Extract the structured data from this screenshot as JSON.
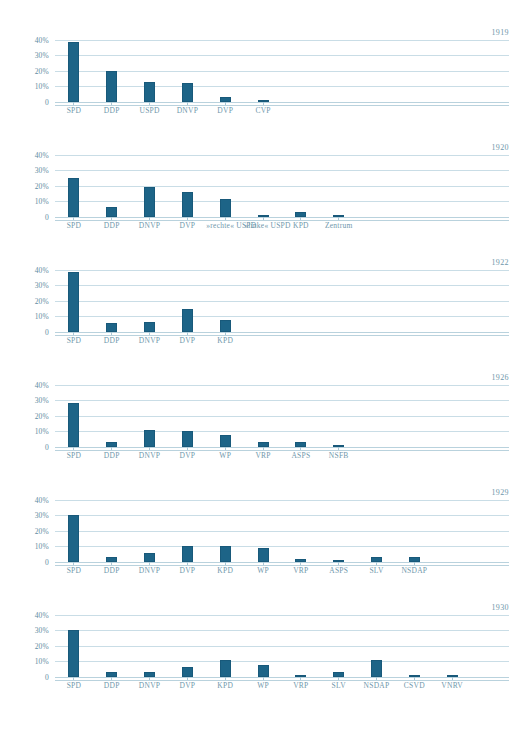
{
  "style": {
    "bar_color": "#1d6487",
    "grid_color": "#c9dde6",
    "label_color": "#6f97ab",
    "background": "#ffffff"
  },
  "axis": {
    "ticks": [
      "40%",
      "30%",
      "20%",
      "10%",
      "0"
    ],
    "values": [
      40,
      30,
      20,
      10,
      0
    ],
    "ymax": 45
  },
  "chart_data": [
    {
      "type": "bar",
      "title": "1919",
      "xlabel": "",
      "ylabel": "",
      "ylim": [
        0,
        45
      ],
      "yticks": [
        0,
        10,
        20,
        30,
        40
      ],
      "ytick_labels": [
        "0",
        "10%",
        "20%",
        "30%",
        "40%"
      ],
      "grid": true,
      "legend": "none",
      "categories": [
        "SPD",
        "DDP",
        "USPD",
        "DNVP",
        "DVP",
        "CVP"
      ],
      "values": [
        38.5,
        20.0,
        13.0,
        12.0,
        3.0,
        1.0
      ]
    },
    {
      "type": "bar",
      "title": "1920",
      "xlabel": "",
      "ylabel": "",
      "ylim": [
        0,
        45
      ],
      "yticks": [
        0,
        10,
        20,
        30,
        40
      ],
      "ytick_labels": [
        "0",
        "10%",
        "20%",
        "30%",
        "40%"
      ],
      "grid": true,
      "legend": "none",
      "categories": [
        "SPD",
        "DDP",
        "DNVP",
        "DVP",
        "»rechte« USPD",
        "»linke« USPD",
        "KPD",
        "Zentrum"
      ],
      "values": [
        25.0,
        6.5,
        19.0,
        16.0,
        11.5,
        0.5,
        3.5,
        0.2
      ]
    },
    {
      "type": "bar",
      "title": "1922",
      "xlabel": "",
      "ylabel": "",
      "ylim": [
        0,
        45
      ],
      "yticks": [
        0,
        10,
        20,
        30,
        40
      ],
      "ytick_labels": [
        "0",
        "10%",
        "20%",
        "30%",
        "40%"
      ],
      "grid": true,
      "legend": "none",
      "categories": [
        "SPD",
        "DDP",
        "DNVP",
        "DVP",
        "KPD"
      ],
      "values": [
        38.5,
        6.0,
        6.5,
        15.0,
        8.0
      ]
    },
    {
      "type": "bar",
      "title": "1926",
      "xlabel": "",
      "ylabel": "",
      "ylim": [
        0,
        45
      ],
      "yticks": [
        0,
        10,
        20,
        30,
        40
      ],
      "ytick_labels": [
        "0",
        "10%",
        "20%",
        "30%",
        "40%"
      ],
      "grid": true,
      "legend": "none",
      "categories": [
        "SPD",
        "DDP",
        "DNVP",
        "DVP",
        "WP",
        "VRP",
        "ASPS",
        "NSFB"
      ],
      "values": [
        28.5,
        3.0,
        11.0,
        10.0,
        8.0,
        3.0,
        3.0,
        1.0
      ]
    },
    {
      "type": "bar",
      "title": "1929",
      "xlabel": "",
      "ylabel": "",
      "ylim": [
        0,
        45
      ],
      "yticks": [
        0,
        10,
        20,
        30,
        40
      ],
      "ytick_labels": [
        "0",
        "10%",
        "20%",
        "30%",
        "40%"
      ],
      "grid": true,
      "legend": "none",
      "categories": [
        "SPD",
        "DDP",
        "DNVP",
        "DVP",
        "KPD",
        "WP",
        "VRP",
        "ASPS",
        "SLV",
        "NSDAP"
      ],
      "values": [
        30.0,
        3.0,
        6.0,
        10.5,
        10.0,
        9.0,
        2.0,
        1.0,
        3.5,
        3.0
      ]
    },
    {
      "type": "bar",
      "title": "1930",
      "xlabel": "",
      "ylabel": "",
      "ylim": [
        0,
        45
      ],
      "yticks": [
        0,
        10,
        20,
        30,
        40
      ],
      "ytick_labels": [
        "0",
        "10%",
        "20%",
        "30%",
        "40%"
      ],
      "grid": true,
      "legend": "none",
      "categories": [
        "SPD",
        "DDP",
        "DNVP",
        "DVP",
        "KPD",
        "WP",
        "VRP",
        "SLV",
        "NSDAP",
        "CSVD",
        "VNRV"
      ],
      "values": [
        30.0,
        3.0,
        3.5,
        6.5,
        11.0,
        8.0,
        1.0,
        3.5,
        11.0,
        1.5,
        1.0
      ]
    }
  ]
}
